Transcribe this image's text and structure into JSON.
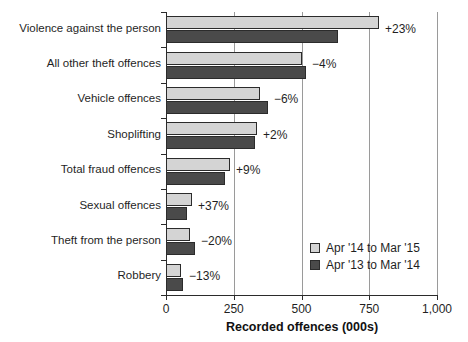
{
  "chart_data": {
    "type": "bar",
    "orientation": "horizontal",
    "title": "",
    "xlabel": "Recorded offences (000s)",
    "ylabel": "",
    "xlim": [
      0,
      1000
    ],
    "xticks": [
      "0",
      "250",
      "500",
      "750",
      "1,000"
    ],
    "xtick_values": [
      0,
      250,
      500,
      750,
      1000
    ],
    "grid": "vertical",
    "legend_position": "inside-right-lower",
    "categories": [
      "Violence against the person",
      "All other theft offences",
      "Vehicle offences",
      "Shoplifting",
      "Total fraud offences",
      "Sexual offences",
      "Theft from the person",
      "Robbery"
    ],
    "series": [
      {
        "name": "Apr '14 to Mar '15",
        "color": "#d4d4d4",
        "values": [
          786,
          502,
          347,
          336,
          236,
          96,
          89,
          55
        ]
      },
      {
        "name": "Apr '13 to Mar '14",
        "color": "#4a4a4a",
        "values": [
          635,
          517,
          376,
          330,
          218,
          77,
          107,
          63
        ]
      }
    ],
    "change_labels": [
      "+23%",
      "−4%",
      "−6%",
      "+2%",
      "+9%",
      "+37%",
      "−20%",
      "−13%"
    ]
  },
  "legend": {
    "items": [
      {
        "label": "Apr '14 to Mar '15",
        "swatch": "light"
      },
      {
        "label": "Apr '13 to Mar '14",
        "swatch": "dark"
      }
    ]
  },
  "colors": {
    "light_bar": "#d4d4d4",
    "dark_bar": "#4a4a4a",
    "axis": "#2b2b2b",
    "gridline": "#9a9a9a",
    "text": "#1f1f1f",
    "background": "#ffffff"
  }
}
